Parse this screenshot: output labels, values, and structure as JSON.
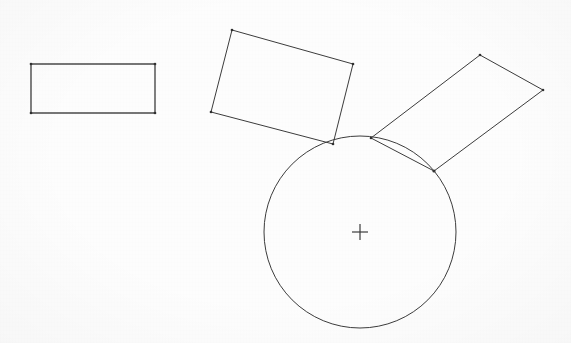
{
  "document": {
    "title": "Geometric Construction Drawing",
    "background_color": "#fdfdfd",
    "stroke_color": "#3c3c3c",
    "width": 571,
    "height": 343
  },
  "chart_data": {
    "type": "scatter",
    "subtitle": "Three rectangles and one circle with center mark",
    "xlabel": "",
    "ylabel": "",
    "grid": false,
    "legend": null,
    "xlim": [
      0,
      571
    ],
    "ylim": [
      0,
      343
    ],
    "shapes": [
      {
        "name": "axis-aligned-rectangle",
        "type": "rectangle",
        "rotation_deg": 0,
        "vertices": [
          [
            31,
            64
          ],
          [
            155,
            64
          ],
          [
            155,
            113
          ],
          [
            31,
            113
          ]
        ],
        "width": 124,
        "height": 49,
        "tangent_to_circle": false
      },
      {
        "name": "tilted-rectangle-left",
        "type": "rectangle",
        "rotation_deg": -16.5,
        "vertices": [
          [
            232,
            30
          ],
          [
            353,
            64
          ],
          [
            333,
            144
          ],
          [
            211,
            112
          ]
        ],
        "width": 125,
        "height": 83,
        "tangent_to_circle": true
      },
      {
        "name": "tilted-rectangle-right",
        "type": "rectangle",
        "rotation_deg": -41,
        "vertices": [
          [
            480,
            55
          ],
          [
            543,
            90
          ],
          [
            434,
            171
          ],
          [
            371,
            138
          ]
        ],
        "width": 72,
        "height": 135,
        "tangent_to_circle": true
      },
      {
        "name": "circle",
        "type": "circle",
        "center": [
          360,
          232
        ],
        "radius": 96,
        "center_mark": true
      }
    ],
    "tangency_points": [
      [
        334,
        144
      ],
      [
        372,
        138
      ],
      [
        434,
        171
      ]
    ]
  },
  "legend_labels": {
    "rect_1": "Rectangle 1",
    "rect_2": "Rectangle 2",
    "rect_3": "Rectangle 3",
    "circle": "Circle",
    "center": "Center mark"
  }
}
